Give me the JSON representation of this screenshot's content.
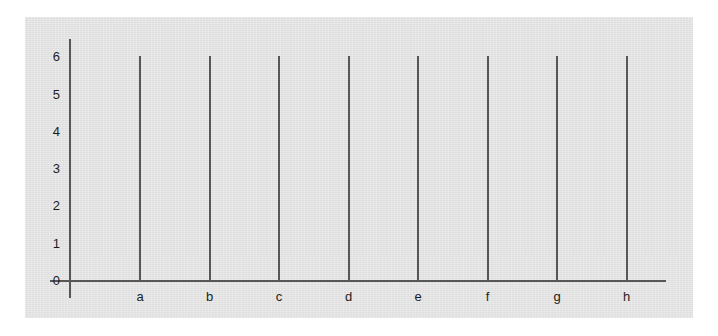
{
  "chart_data": {
    "type": "bar",
    "title": "",
    "subtitle": "",
    "xlabel": "",
    "ylabel": "",
    "categories": [
      "a",
      "b",
      "c",
      "d",
      "e",
      "f",
      "g",
      "h"
    ],
    "values": [
      6,
      6,
      6,
      6,
      6,
      6,
      6,
      6
    ],
    "ylim": [
      0,
      6
    ],
    "xlim": [
      0,
      8
    ],
    "y_ticks": [
      0,
      1,
      2,
      3,
      4,
      5,
      6
    ],
    "y_tick_labels": [
      "0",
      "1",
      "2",
      "3",
      "4",
      "5",
      "6"
    ],
    "x_tick_labels": [
      "a",
      "b",
      "c",
      "d",
      "e",
      "f",
      "g",
      "h"
    ],
    "grid": false,
    "legend": null,
    "legend_position": "none",
    "annotations": [],
    "bar_style": "thin-line",
    "colors": {
      "panel_background": "#e2e2e2",
      "page_background": "#ffffff",
      "axis": "#575757",
      "bar": "#575757",
      "tick_text": "#1d1d1d"
    }
  }
}
